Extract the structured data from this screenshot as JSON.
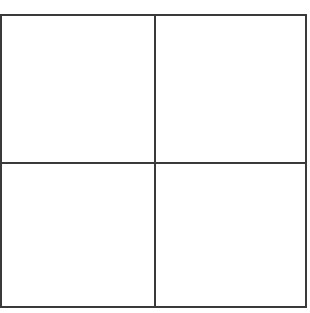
{
  "diagram": {
    "type": "2x2 grid",
    "rows": 2,
    "columns": 2,
    "cells": [
      {
        "position": "top-left",
        "label": ""
      },
      {
        "position": "top-right",
        "label": ""
      },
      {
        "position": "bottom-left",
        "label": ""
      },
      {
        "position": "bottom-right",
        "label": ""
      }
    ],
    "line_color": "#3a3a3a",
    "background": "#ffffff"
  }
}
